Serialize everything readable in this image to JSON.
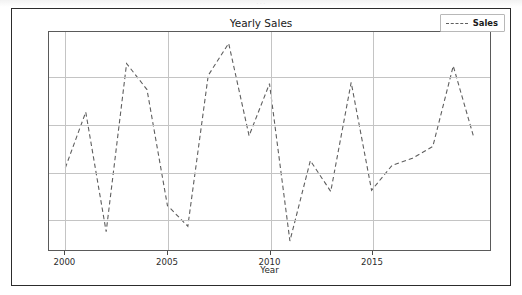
{
  "figure": {
    "title": "Yearly Sales",
    "top_artifact_text": "· · ·"
  },
  "legend": {
    "label": "Sales",
    "position": "upper right",
    "line_style": "dashed",
    "color": "#5e5e5e"
  },
  "axes": {
    "xlabel": "Year",
    "ylabel": "",
    "xticks": [
      2000,
      2005,
      2010,
      2015
    ],
    "yticks": [
      2000,
      4000,
      6000,
      8000
    ],
    "xlim": [
      1999.2,
      2020.8
    ],
    "ylim": [
      680,
      9880
    ],
    "grid": true
  },
  "chart_data": {
    "type": "line",
    "title": "Yearly Sales",
    "xlabel": "Year",
    "ylabel": "",
    "grid": true,
    "legend_position": "upper right",
    "xlim": [
      1999.2,
      2020.8
    ],
    "ylim": [
      680,
      9880
    ],
    "xticks": [
      2000,
      2005,
      2010,
      2015
    ],
    "yticks": [
      2000,
      4000,
      6000,
      8000
    ],
    "x": [
      2000,
      2001,
      2002,
      2003,
      2004,
      2005,
      2006,
      2007,
      2008,
      2009,
      2010,
      2011,
      2012,
      2013,
      2014,
      2015,
      2016,
      2017,
      2018,
      2019,
      2020
    ],
    "series": [
      {
        "name": "Sales",
        "style": "dashed",
        "color": "#5e5e5e",
        "values": [
          4150,
          6500,
          1450,
          8550,
          7450,
          2560,
          1680,
          8050,
          9400,
          5500,
          7700,
          1060,
          4450,
          3150,
          7750,
          3200,
          4250,
          4550,
          5050,
          8450,
          5450
        ]
      }
    ]
  }
}
